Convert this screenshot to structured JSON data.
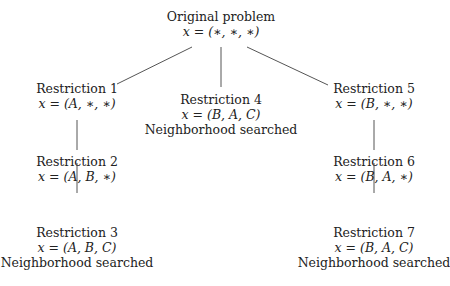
{
  "diagram": {
    "type": "tree",
    "nodes": [
      {
        "id": "root",
        "title": "Original problem",
        "assignment": "x = (∗, ∗, ∗)",
        "status": ""
      },
      {
        "id": "r1",
        "title": "Restriction 1",
        "assignment": "x = (A, ∗, ∗)",
        "status": ""
      },
      {
        "id": "r2",
        "title": "Restriction 2",
        "assignment": "x = (A, B, ∗)",
        "status": ""
      },
      {
        "id": "r3",
        "title": "Restriction 3",
        "assignment": "x = (A, B, C)",
        "status": "Neighborhood searched"
      },
      {
        "id": "r4",
        "title": "Restriction 4",
        "assignment": "x = (B, A, C)",
        "status": "Neighborhood searched"
      },
      {
        "id": "r5",
        "title": "Restriction 5",
        "assignment": "x = (B, ∗, ∗)",
        "status": ""
      },
      {
        "id": "r6",
        "title": "Restriction 6",
        "assignment": "x = (B, A, ∗)",
        "status": ""
      },
      {
        "id": "r7",
        "title": "Restriction 7",
        "assignment": "x = (B, A, C)",
        "status": "Neighborhood searched"
      }
    ],
    "edges": [
      [
        "root",
        "r1"
      ],
      [
        "root",
        "r4"
      ],
      [
        "root",
        "r5"
      ],
      [
        "r1",
        "r2"
      ],
      [
        "r2",
        "r3"
      ],
      [
        "r5",
        "r6"
      ],
      [
        "r6",
        "r7"
      ]
    ]
  }
}
